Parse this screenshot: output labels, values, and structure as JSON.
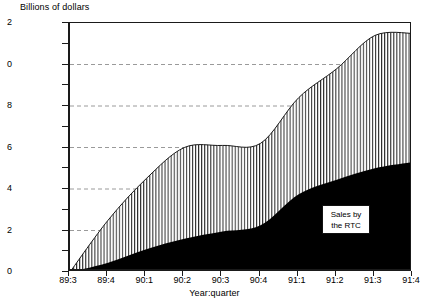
{
  "chart_data": {
    "type": "area",
    "title": "Billions of dollars",
    "xlabel": "Year:quarter",
    "ylabel": "",
    "stacked": true,
    "grid": "horizontal-dashed",
    "ylim": [
      0,
      12
    ],
    "ytick_step": 2,
    "yminor_step": 1,
    "ytick_labels": [
      "0",
      "2",
      "4",
      "6",
      "8",
      "10",
      "12"
    ],
    "ytick_labels_clipped": [
      "0",
      "2",
      "4",
      "6",
      "8",
      "0",
      "2"
    ],
    "categories": [
      "89:3",
      "89:4",
      "90:1",
      "90:2",
      "90:3",
      "90:4",
      "91:1",
      "91:2",
      "91:3",
      "91:4"
    ],
    "x": [
      "89:3",
      "89:4",
      "90:1",
      "90:2",
      "90:3",
      "90:4",
      "91:1",
      "91:2",
      "91:3",
      "91:4"
    ],
    "series": [
      {
        "name": "Sales by the RTC",
        "fill": "solid-black",
        "color": "#000000",
        "values": [
          0.0,
          0.45,
          1.1,
          1.6,
          1.95,
          2.25,
          3.75,
          4.45,
          5.0,
          5.3
        ]
      },
      {
        "name": "Remaining assets",
        "fill": "vertical-hatch",
        "color": "#ffffff",
        "values": [
          0.0,
          2.5,
          4.5,
          6.0,
          6.1,
          6.2,
          8.4,
          9.8,
          11.4,
          11.5
        ]
      }
    ],
    "annotations": [
      {
        "text_line_1": "Sales by",
        "text_line_2": "the RTC",
        "x": "91:1",
        "y": 3.0
      }
    ]
  },
  "legend": {
    "line1": "Sales by",
    "line2": "the RTC"
  },
  "axis": {
    "y_ticks": [
      {
        "label": "2",
        "value": 12
      },
      {
        "label": "0",
        "value": 10
      },
      {
        "label": "8",
        "value": 8
      },
      {
        "label": "6",
        "value": 6
      },
      {
        "label": "4",
        "value": 4
      },
      {
        "label": "2",
        "value": 2
      },
      {
        "label": "0",
        "value": 0
      }
    ]
  },
  "colors": {
    "axis": "#1a1a1a",
    "grid": "#9a9a9a",
    "black_series": "#000000",
    "hatch_stroke": "#2a2a2a",
    "background": "#ffffff"
  }
}
